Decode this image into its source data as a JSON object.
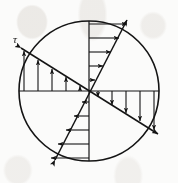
{
  "figure": {
    "name": "shear-stress-distribution-circular-section",
    "background_color": "#fbfbfa",
    "stroke_color": "#141414",
    "label_tau": "τ",
    "width": 178,
    "height": 183
  },
  "chart_data": {
    "type": "line",
    "xlabel": "",
    "ylabel": "",
    "grid": false,
    "legend": null,
    "annotations": [
      {
        "text": "τ",
        "x": 13,
        "y": 43,
        "描述": "shear stress symbol at upper-left arrow tail"
      }
    ],
    "geometry": {
      "circle": {
        "cx": 89,
        "cy": 91,
        "r": 70,
        "stroke": "#141414",
        "stroke_width": 1.6
      },
      "axes": [
        {
          "name": "horizontal-diameter",
          "x1": 19,
          "y1": 91,
          "x2": 159,
          "y2": 91
        },
        {
          "name": "vertical-diameter",
          "x1": 89,
          "y1": 21,
          "x2": 89,
          "y2": 161
        }
      ],
      "envelopes": [
        {
          "name": "shallow-diagonal-envelope",
          "x1": 21,
          "y1": 48,
          "x2": 158,
          "y2": 134,
          "arrow_at": "both",
          "description": "shallow descending line from upper-left rim to lower-right rim"
        },
        {
          "name": "steep-diagonal-envelope",
          "x1": 55,
          "y1": 160,
          "x2": 127,
          "y2": 20,
          "arrow_at": "both",
          "description": "steep ascending line from lower-left rim to upper-right rim"
        }
      ]
    },
    "series": [
      {
        "name": "upper-left-quadrant-upward-arrows",
        "direction": "up",
        "base_line": "horizontal-diameter",
        "orientation": "vertical",
        "x": [
          24,
          38,
          52,
          66,
          80
        ],
        "lengths": [
          40,
          31,
          22,
          14,
          5
        ]
      },
      {
        "name": "upper-right-quadrant-rightward-arrows",
        "direction": "right",
        "base_line": "vertical-diameter",
        "orientation": "horizontal",
        "y": [
          24,
          38,
          52,
          66,
          80
        ],
        "lengths": [
          38,
          30,
          22,
          14,
          6
        ]
      },
      {
        "name": "lower-right-quadrant-downward-arrows",
        "direction": "down",
        "base_line": "horizontal-diameter",
        "orientation": "vertical",
        "x": [
          98,
          112,
          126,
          140,
          154
        ],
        "lengths": [
          6,
          14,
          22,
          30,
          39
        ]
      },
      {
        "name": "lower-left-quadrant-leftward-arrows",
        "direction": "left",
        "base_line": "vertical-diameter",
        "orientation": "horizontal",
        "y": [
          102,
          116,
          130,
          144,
          158
        ],
        "lengths": [
          7,
          15,
          23,
          31,
          38
        ]
      }
    ]
  }
}
